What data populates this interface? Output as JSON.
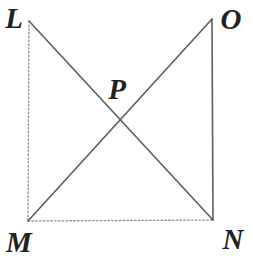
{
  "figure": {
    "canvas": {
      "width": 253,
      "height": 269,
      "background": "#ffffff"
    },
    "colors": {
      "solid_line": "#5d5d5d",
      "dashed_line": "#8f8f8f",
      "label": "#222222"
    },
    "points": {
      "L": {
        "x": 29,
        "y": 21
      },
      "O": {
        "x": 212,
        "y": 19
      },
      "M": {
        "x": 28,
        "y": 221
      },
      "N": {
        "x": 213,
        "y": 220
      },
      "P": {
        "x": 120,
        "y": 120
      }
    },
    "edges": [
      {
        "from": "L",
        "to": "M",
        "style": "dashed"
      },
      {
        "from": "M",
        "to": "N",
        "style": "dashed"
      },
      {
        "from": "O",
        "to": "N",
        "style": "solid"
      },
      {
        "from": "L",
        "to": "N",
        "style": "solid"
      },
      {
        "from": "M",
        "to": "O",
        "style": "solid"
      }
    ],
    "labels": [
      {
        "text": "L",
        "x": 14,
        "y": 28
      },
      {
        "text": "O",
        "x": 231,
        "y": 29
      },
      {
        "text": "P",
        "x": 117,
        "y": 99
      },
      {
        "text": "M",
        "x": 19,
        "y": 252
      },
      {
        "text": "N",
        "x": 233,
        "y": 249
      }
    ]
  }
}
